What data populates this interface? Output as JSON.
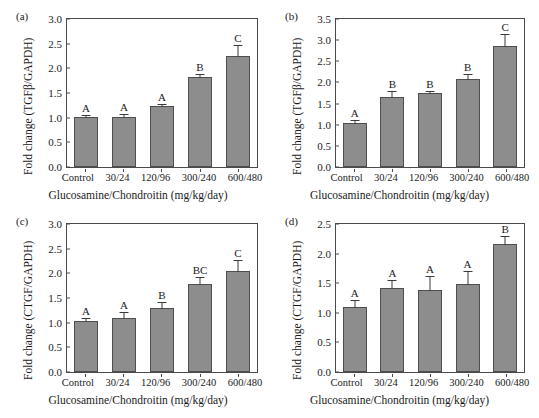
{
  "figure": {
    "background": "#ffffff",
    "bar_fill": "#8d8d8d",
    "bar_border": "#4e4e4e",
    "axis_color": "#4a4a4a"
  },
  "chart_data": [
    {
      "type": "bar",
      "panel": "(a)",
      "title": "",
      "ylabel": "Fold change (TGFβ/GAPDH)",
      "xlabel": "Glucosamine/Chondroitin (mg/kg/day)",
      "categories": [
        "Control",
        "30/24",
        "120/96",
        "300/240",
        "600/480"
      ],
      "values": [
        1.02,
        1.01,
        1.23,
        1.83,
        2.26
      ],
      "errors": [
        0.12,
        0.22,
        0.13,
        0.11,
        0.3
      ],
      "sig_labels": [
        "A",
        "A",
        "A",
        "B",
        "C"
      ],
      "ylim": [
        0.0,
        3.0
      ],
      "yticks": [
        "0.0",
        "0.5",
        "1.0",
        "1.5",
        "2.0",
        "2.5",
        "3.0"
      ],
      "grid": false,
      "legend": "none"
    },
    {
      "type": "bar",
      "panel": "(b)",
      "title": "",
      "ylabel": "Fold change (TGFβ/GAPDH)",
      "xlabel": "Glucosamine/Chondroitin (mg/kg/day)",
      "categories": [
        "Control",
        "30/24",
        "120/96",
        "300/240",
        "600/480"
      ],
      "values": [
        1.05,
        1.65,
        1.74,
        2.08,
        2.87
      ],
      "errors": [
        0.21,
        0.3,
        0.12,
        0.2,
        0.33
      ],
      "sig_labels": [
        "A",
        "B",
        "B",
        "B",
        "C"
      ],
      "ylim": [
        0.0,
        3.5
      ],
      "yticks": [
        "0.0",
        "0.5",
        "1.0",
        "1.5",
        "2.0",
        "2.5",
        "3.0",
        "3.5"
      ],
      "grid": false,
      "legend": "none"
    },
    {
      "type": "bar",
      "panel": "(c)",
      "title": "",
      "ylabel": "Fold change (CTGF/GAPDH)",
      "xlabel": "Glucosamine/Chondroitin (mg/kg/day)",
      "categories": [
        "Control",
        "30/24",
        "120/96",
        "300/240",
        "600/480"
      ],
      "values": [
        1.03,
        1.1,
        1.29,
        1.79,
        2.05
      ],
      "errors": [
        0.2,
        0.31,
        0.29,
        0.25,
        0.33
      ],
      "sig_labels": [
        "A",
        "A",
        "B",
        "BC",
        "C"
      ],
      "ylim": [
        0.0,
        3.0
      ],
      "yticks": [
        "0.0",
        "0.5",
        "1.0",
        "1.5",
        "2.0",
        "2.5",
        "3.0"
      ],
      "grid": false,
      "legend": "none"
    },
    {
      "type": "bar",
      "panel": "(d)",
      "title": "",
      "ylabel": "Fold change (CTGF/GAPDH)",
      "xlabel": "Glucosamine/Chondroitin (mg/kg/day)",
      "categories": [
        "Control",
        "30/24",
        "120/96",
        "300/240",
        "600/480"
      ],
      "values": [
        1.09,
        1.42,
        1.39,
        1.48,
        2.17
      ],
      "errors": [
        0.3,
        0.25,
        0.42,
        0.38,
        0.14
      ],
      "sig_labels": [
        "A",
        "A",
        "A",
        "A",
        "B"
      ],
      "ylim": [
        0.0,
        2.5
      ],
      "yticks": [
        "0.0",
        "0.5",
        "1.0",
        "1.5",
        "2.0",
        "2.5"
      ],
      "grid": false,
      "legend": "none"
    }
  ]
}
